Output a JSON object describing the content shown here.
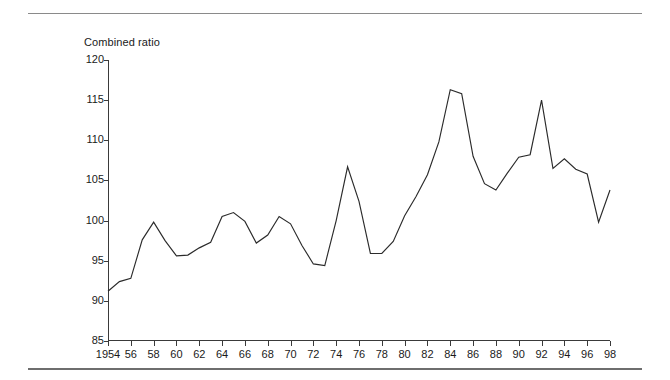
{
  "chart_data": {
    "type": "line",
    "title": "Combined ratio",
    "xlabel": "",
    "ylabel": "Combined ratio",
    "ylim": [
      85,
      120
    ],
    "xlim": [
      1954,
      1998
    ],
    "yticks": [
      85,
      90,
      95,
      100,
      105,
      110,
      115,
      120
    ],
    "ytick_labels": [
      "85",
      "90",
      "95",
      "100",
      "105",
      "110",
      "115",
      "120"
    ],
    "xticks": [
      1954,
      1956,
      1958,
      1960,
      1962,
      1964,
      1966,
      1968,
      1970,
      1972,
      1974,
      1976,
      1978,
      1980,
      1982,
      1984,
      1986,
      1988,
      1990,
      1992,
      1994,
      1996,
      1998
    ],
    "xtick_labels": [
      "1954",
      "56",
      "58",
      "60",
      "62",
      "64",
      "66",
      "68",
      "70",
      "72",
      "74",
      "76",
      "78",
      "80",
      "82",
      "84",
      "86",
      "88",
      "90",
      "92",
      "94",
      "96",
      "98"
    ],
    "grid": false,
    "legend": "none",
    "line_color": "#2b2b2b",
    "x": [
      1954,
      1955,
      1956,
      1957,
      1958,
      1959,
      1960,
      1961,
      1962,
      1963,
      1964,
      1965,
      1966,
      1967,
      1968,
      1969,
      1970,
      1971,
      1972,
      1973,
      1974,
      1975,
      1976,
      1977,
      1978,
      1979,
      1980,
      1981,
      1982,
      1983,
      1984,
      1985,
      1986,
      1987,
      1988,
      1989,
      1990,
      1991,
      1992,
      1993,
      1994,
      1995,
      1996,
      1997,
      1998
    ],
    "values": [
      91.2,
      92.4,
      92.8,
      97.6,
      99.8,
      97.5,
      95.6,
      95.7,
      96.6,
      97.3,
      100.5,
      101.0,
      99.9,
      97.2,
      98.2,
      100.5,
      99.6,
      96.9,
      94.6,
      94.4,
      100.0,
      106.7,
      102.4,
      95.9,
      95.9,
      97.4,
      100.6,
      103.0,
      105.7,
      109.8,
      116.3,
      115.8,
      108.0,
      104.6,
      103.8,
      105.9,
      107.9,
      108.2,
      115.0,
      106.5,
      107.7,
      106.4,
      105.8,
      99.8,
      103.8
    ],
    "series": [
      {
        "name": "Combined ratio",
        "values": [
          91.2,
          92.4,
          92.8,
          97.6,
          99.8,
          97.5,
          95.6,
          95.7,
          96.6,
          97.3,
          100.5,
          101.0,
          99.9,
          97.2,
          98.2,
          100.5,
          99.6,
          96.9,
          94.6,
          94.4,
          100.0,
          106.7,
          102.4,
          95.9,
          95.9,
          97.4,
          100.6,
          103.0,
          105.7,
          109.8,
          116.3,
          115.8,
          108.0,
          104.6,
          103.8,
          105.9,
          107.9,
          108.2,
          115.0,
          106.5,
          107.7,
          106.4,
          105.8,
          99.8,
          103.8
        ]
      }
    ]
  }
}
